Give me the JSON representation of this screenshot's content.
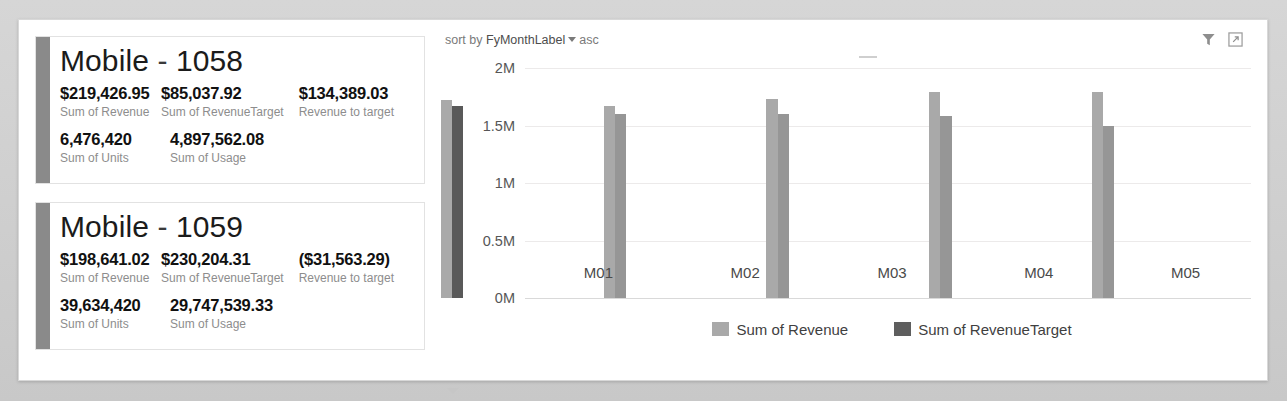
{
  "toolbar": {
    "sort_prefix": "sort by",
    "sort_field": "FyMonthLabel",
    "sort_direction": "asc",
    "filter_icon": "filter-funnel-icon",
    "focus_icon": "focus-mode-icon"
  },
  "cards": [
    {
      "title_name": "Mobile",
      "title_sep": "-",
      "title_id": "1058",
      "metrics": [
        {
          "value": "$219,426.95",
          "label": "Sum of Revenue"
        },
        {
          "value": "$85,037.92",
          "label": "Sum of RevenueTarget"
        },
        {
          "value": "$134,389.03",
          "label": "Revenue to target"
        },
        {
          "value": "6,476,420",
          "label": "Sum of Units"
        },
        {
          "value": "4,897,562.08",
          "label": "Sum of Usage"
        }
      ]
    },
    {
      "title_name": "Mobile",
      "title_sep": "-",
      "title_id": "1059",
      "metrics": [
        {
          "value": "$198,641.02",
          "label": "Sum of Revenue"
        },
        {
          "value": "$230,204.31",
          "label": "Sum of RevenueTarget"
        },
        {
          "value": "($31,563.29)",
          "label": "Revenue to target"
        },
        {
          "value": "39,634,420",
          "label": "Sum of Units"
        },
        {
          "value": "29,747,539.33",
          "label": "Sum of Usage"
        }
      ]
    }
  ],
  "chart_data": {
    "type": "bar",
    "title": "",
    "xlabel": "",
    "ylabel": "(Millions)",
    "categories": [
      "M01",
      "M02",
      "M03",
      "M04",
      "M05"
    ],
    "series": [
      {
        "name": "Sum of Revenue",
        "color": "#a9a9a9",
        "values": [
          1.72,
          1.67,
          1.73,
          1.79,
          1.79
        ]
      },
      {
        "name": "Sum of RevenueTarget",
        "color": "#5e5e5e",
        "values": [
          1.67,
          1.6,
          1.6,
          1.58,
          1.5
        ]
      }
    ],
    "selected_bar": {
      "series": "Sum of RevenueTarget",
      "category": "M01"
    },
    "ylim": [
      0,
      2
    ],
    "yticks": [
      "0M",
      "0.5M",
      "1M",
      "1.5M",
      "2M"
    ],
    "ytick_values": [
      0,
      0.5,
      1,
      1.5,
      2
    ],
    "grid": true,
    "legend_position": "bottom"
  }
}
